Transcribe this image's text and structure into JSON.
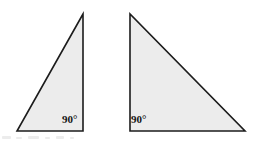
{
  "figure": {
    "background_color": "#ffffff",
    "shape_fill_color": "#ececec",
    "shape_stroke_color": "#1c1c1c",
    "label_color": "#161616",
    "stroke_width": 1.6,
    "canvas": {
      "width": 255,
      "height": 141
    },
    "shapes": [
      {
        "name": "left-triangle",
        "kind": "right-triangle",
        "orientation": "right-angle-bottom-right",
        "points": "83,14 17,131 83,131",
        "vertices": [
          {
            "name": "apex",
            "x": 83,
            "y": 14
          },
          {
            "name": "bottom-left",
            "x": 17,
            "y": 131
          },
          {
            "name": "bottom-right",
            "x": 83,
            "y": 131
          }
        ],
        "angle_label": "90°",
        "angle_label_position": {
          "x": 62,
          "y": 114
        }
      },
      {
        "name": "right-triangle",
        "kind": "right-triangle",
        "orientation": "right-angle-bottom-left",
        "points": "130,14 130,131 245,131",
        "vertices": [
          {
            "name": "apex",
            "x": 130,
            "y": 14
          },
          {
            "name": "bottom-left",
            "x": 130,
            "y": 131
          },
          {
            "name": "bottom-right",
            "x": 245,
            "y": 131
          }
        ],
        "angle_label": "90°",
        "angle_label_position": {
          "x": 131,
          "y": 114
        }
      }
    ],
    "artifacts": [
      {
        "name": "scan-mark-1",
        "x": 2,
        "y": 136,
        "width": 9,
        "height": 3
      },
      {
        "name": "scan-mark-2",
        "x": 16,
        "y": 137,
        "width": 6,
        "height": 2
      },
      {
        "name": "scan-mark-3",
        "x": 28,
        "y": 136,
        "width": 11,
        "height": 3
      },
      {
        "name": "scan-mark-4",
        "x": 45,
        "y": 137,
        "width": 5,
        "height": 2
      },
      {
        "name": "scan-mark-5",
        "x": 56,
        "y": 136,
        "width": 8,
        "height": 3
      },
      {
        "name": "scan-mark-6",
        "x": 70,
        "y": 137,
        "width": 4,
        "height": 2
      }
    ]
  }
}
